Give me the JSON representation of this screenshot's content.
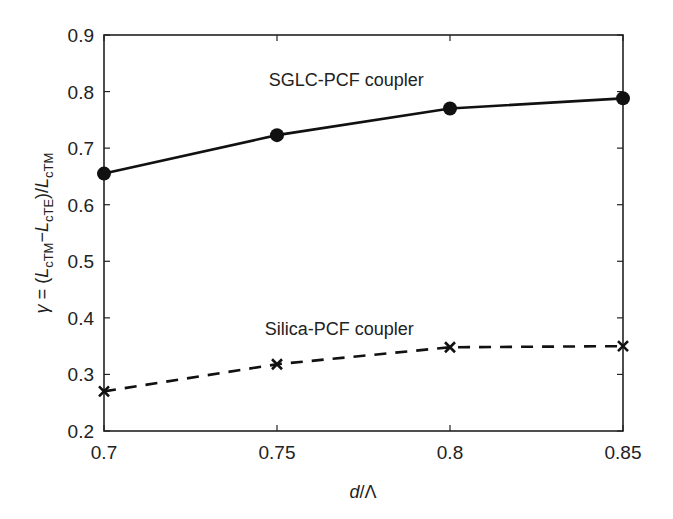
{
  "chart_data": {
    "type": "line",
    "title": "",
    "xlabel": "d/Λ",
    "ylabel": "γ = (L_cTM − L_cTE)/L_cTM",
    "x": [
      0.7,
      0.75,
      0.8,
      0.85
    ],
    "xlim": [
      0.7,
      0.85
    ],
    "ylim": [
      0.2,
      0.9
    ],
    "x_ticks": [
      "0.7",
      "0.75",
      "0.8",
      "0.85"
    ],
    "y_ticks": [
      "0.2",
      "0.3",
      "0.4",
      "0.5",
      "0.6",
      "0.7",
      "0.8",
      "0.9"
    ],
    "grid": false,
    "legend": "none (inline annotations)",
    "series": [
      {
        "name": "SGLC-PCF coupler",
        "values": [
          0.655,
          0.723,
          0.77,
          0.788
        ],
        "line_style": "solid",
        "marker": "filled-circle",
        "color": "#111111"
      },
      {
        "name": "Silica-PCF coupler",
        "values": [
          0.27,
          0.318,
          0.348,
          0.35
        ],
        "line_style": "dashed",
        "marker": "x",
        "color": "#111111"
      }
    ],
    "annotations": [
      {
        "text": "SGLC-PCF coupler",
        "x": 0.77,
        "y": 0.82
      },
      {
        "text": "Silica-PCF coupler",
        "x": 0.768,
        "y": 0.38
      }
    ]
  },
  "axes": {
    "xlabel_italic": "d",
    "xlabel_rest": "/Λ",
    "ylabel_parts": {
      "gamma": "γ",
      "eq": " = (",
      "L1": "L",
      "sub1": "cTM",
      "minus": "−",
      "L2": "L",
      "sub2": "cTE",
      "close": ")/",
      "L3": "L",
      "sub3": "cTM"
    }
  }
}
